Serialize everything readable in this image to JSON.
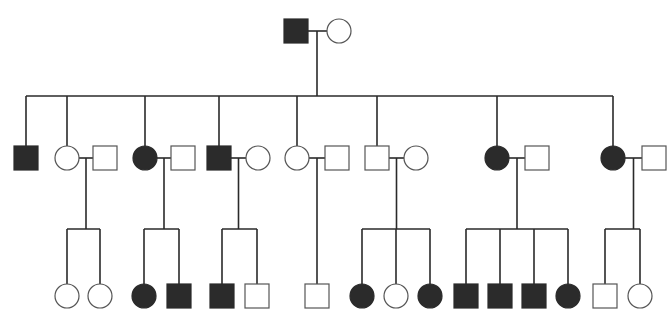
{
  "diagram": {
    "type": "pedigree",
    "legend": {
      "square": "male",
      "circle": "female",
      "filled": "affected",
      "open": "unaffected"
    },
    "generations": [
      {
        "id": "I",
        "individuals": [
          {
            "id": "I-1",
            "sex": "male",
            "affected": true
          },
          {
            "id": "I-2",
            "sex": "female",
            "affected": false
          }
        ],
        "couples": [
          [
            "I-1",
            "I-2"
          ]
        ]
      },
      {
        "id": "II",
        "individuals": [
          {
            "id": "II-1",
            "sex": "male",
            "affected": true,
            "parents": "I"
          },
          {
            "id": "II-2",
            "sex": "female",
            "affected": false,
            "parents": "I"
          },
          {
            "id": "II-3",
            "sex": "male",
            "affected": false,
            "spouse": "II-2"
          },
          {
            "id": "II-4",
            "sex": "female",
            "affected": true,
            "parents": "I"
          },
          {
            "id": "II-5",
            "sex": "male",
            "affected": false,
            "spouse": "II-4"
          },
          {
            "id": "II-6",
            "sex": "male",
            "affected": true,
            "parents": "I"
          },
          {
            "id": "II-7",
            "sex": "female",
            "affected": false,
            "spouse": "II-6"
          },
          {
            "id": "II-8",
            "sex": "female",
            "affected": false,
            "parents": "I"
          },
          {
            "id": "II-9",
            "sex": "male",
            "affected": false,
            "spouse": "II-8"
          },
          {
            "id": "II-10",
            "sex": "male",
            "affected": false,
            "parents": "I"
          },
          {
            "id": "II-11",
            "sex": "female",
            "affected": false,
            "spouse": "II-10"
          },
          {
            "id": "II-12",
            "sex": "female",
            "affected": true,
            "parents": "I"
          },
          {
            "id": "II-13",
            "sex": "male",
            "affected": false,
            "spouse": "II-12"
          },
          {
            "id": "II-14",
            "sex": "female",
            "affected": true,
            "parents": "I"
          },
          {
            "id": "II-15",
            "sex": "male",
            "affected": false,
            "spouse": "II-14"
          }
        ]
      },
      {
        "id": "III",
        "families": [
          {
            "parents": [
              "II-2",
              "II-3"
            ],
            "children": [
              {
                "sex": "female",
                "affected": false
              },
              {
                "sex": "female",
                "affected": false
              }
            ]
          },
          {
            "parents": [
              "II-4",
              "II-5"
            ],
            "children": [
              {
                "sex": "female",
                "affected": true
              },
              {
                "sex": "male",
                "affected": true
              }
            ]
          },
          {
            "parents": [
              "II-6",
              "II-7"
            ],
            "children": [
              {
                "sex": "male",
                "affected": true
              },
              {
                "sex": "male",
                "affected": false
              }
            ]
          },
          {
            "parents": [
              "II-8",
              "II-9"
            ],
            "children": [
              {
                "sex": "male",
                "affected": false
              }
            ]
          },
          {
            "parents": [
              "II-10",
              "II-11"
            ],
            "children": [
              {
                "sex": "female",
                "affected": true
              },
              {
                "sex": "female",
                "affected": false
              },
              {
                "sex": "female",
                "affected": true
              }
            ]
          },
          {
            "parents": [
              "II-12",
              "II-13"
            ],
            "children": [
              {
                "sex": "male",
                "affected": true
              },
              {
                "sex": "male",
                "affected": true
              },
              {
                "sex": "male",
                "affected": true
              },
              {
                "sex": "female",
                "affected": true
              }
            ]
          },
          {
            "parents": [
              "II-14",
              "II-15"
            ],
            "children": [
              {
                "sex": "male",
                "affected": false
              },
              {
                "sex": "female",
                "affected": false
              }
            ]
          }
        ]
      }
    ]
  }
}
